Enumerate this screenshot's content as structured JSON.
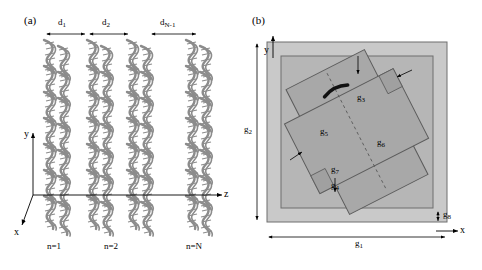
{
  "figure": {
    "panel_a": {
      "label": "(a)",
      "top_dimensions": [
        "d",
        "d",
        "d"
      ],
      "top_dimension_subs": [
        "1",
        "2",
        "N-1"
      ],
      "axis_labels": {
        "y": "y",
        "z": "z",
        "x": "x"
      },
      "column_labels": [
        "n=1",
        "n=2",
        "n=N"
      ],
      "n_columns": 4,
      "rows_per_column": 7,
      "helix_color": "#8c8c8c"
    },
    "panel_b": {
      "label": "(b)",
      "axis_labels": {
        "y": "y",
        "x": "x"
      },
      "dimension_labels": [
        {
          "name": "g",
          "sub": "1"
        },
        {
          "name": "g",
          "sub": "2"
        },
        {
          "name": "g",
          "sub": "3"
        },
        {
          "name": "g",
          "sub": "4"
        },
        {
          "name": "g",
          "sub": "5"
        },
        {
          "name": "g",
          "sub": "6"
        },
        {
          "name": "g",
          "sub": "7"
        },
        {
          "name": "g",
          "sub": "8"
        }
      ],
      "outer_fill": "#c9c9c9",
      "inner_fill": "#b3b3b3",
      "shape_fill": "#a8a8a8",
      "stroke": "#5a5a5a"
    }
  }
}
